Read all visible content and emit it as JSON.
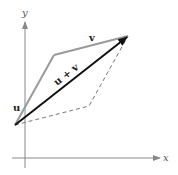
{
  "diagram": {
    "type": "vector-addition-parallelogram",
    "axes": {
      "x_label": "x",
      "y_label": "y"
    },
    "vectors": [
      {
        "name": "u",
        "label": "u",
        "style": "solid-gray"
      },
      {
        "name": "v",
        "label": "v",
        "style": "solid-gray"
      },
      {
        "name": "u+v",
        "label": "u + v",
        "style": "solid-black-arrow"
      }
    ],
    "parallelogram_completion": {
      "style": "dashed"
    },
    "colors": {
      "axis": "#888888",
      "vector_uv": "#9a9a9a",
      "resultant": "#111111",
      "dashed": "#777777"
    }
  }
}
